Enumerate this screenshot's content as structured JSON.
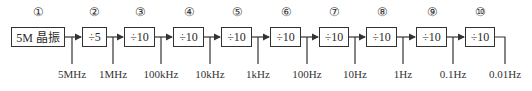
{
  "diagram": {
    "type": "frequency-divider-chain",
    "stages": [
      {
        "index": "①",
        "label": "5M 晶振",
        "output": "5MHz"
      },
      {
        "index": "②",
        "label": "÷5",
        "output": "1MHz"
      },
      {
        "index": "③",
        "label": "÷10",
        "output": "100kHz"
      },
      {
        "index": "④",
        "label": "÷10",
        "output": "10kHz"
      },
      {
        "index": "⑤",
        "label": "÷10",
        "output": "1kHz"
      },
      {
        "index": "⑥",
        "label": "÷10",
        "output": "100Hz"
      },
      {
        "index": "⑦",
        "label": "÷10",
        "output": "10Hz"
      },
      {
        "index": "⑧",
        "label": "÷10",
        "output": "1Hz"
      },
      {
        "index": "⑨",
        "label": "÷10",
        "output": "0.1Hz"
      },
      {
        "index": "⑩",
        "label": "÷10",
        "output": "0.01Hz"
      }
    ]
  }
}
